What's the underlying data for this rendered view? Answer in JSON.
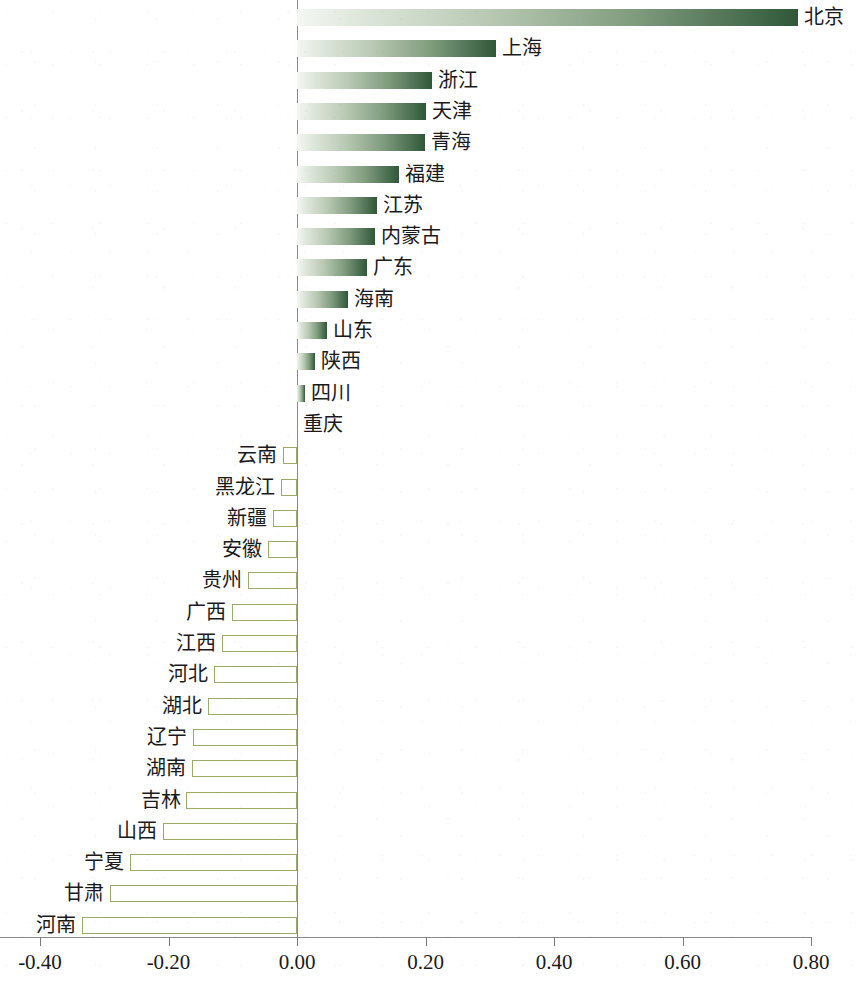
{
  "chart_data": {
    "type": "bar",
    "orientation": "horizontal",
    "title": "",
    "subtitle": "",
    "xlabel": "",
    "ylabel": "",
    "xlim": [
      -0.4,
      0.8
    ],
    "xticks": [
      -0.4,
      -0.2,
      0.0,
      0.2,
      0.4,
      0.6,
      0.8
    ],
    "xtick_labels": [
      "-0.40",
      "-0.20",
      "0.00",
      "0.20",
      "0.40",
      "0.60",
      "0.80"
    ],
    "grid": false,
    "legend": null,
    "legend_position": "none",
    "categories": [
      "北京",
      "上海",
      "浙江",
      "天津",
      "青海",
      "福建",
      "江苏",
      "内蒙古",
      "广东",
      "海南",
      "山东",
      "陕西",
      "四川",
      "重庆",
      "云南",
      "黑龙江",
      "新疆",
      "安徽",
      "贵州",
      "广西",
      "江西",
      "河北",
      "湖北",
      "辽宁",
      "湖南",
      "吉林",
      "山西",
      "宁夏",
      "甘肃",
      "河南"
    ],
    "values": [
      0.78,
      0.31,
      0.21,
      0.2,
      0.199,
      0.159,
      0.125,
      0.121,
      0.109,
      0.079,
      0.047,
      0.028,
      0.012,
      0.0,
      -0.022,
      -0.025,
      -0.037,
      -0.045,
      -0.076,
      -0.101,
      -0.117,
      -0.129,
      -0.139,
      -0.162,
      -0.164,
      -0.172,
      -0.209,
      -0.26,
      -0.291,
      -0.334
    ],
    "colors": {
      "positive_gradient_start": "#f4f7f3",
      "positive_gradient_end": "#2f5738",
      "negative_fill": "#ffffff",
      "negative_border": "#9aab68",
      "axis": "#8a8a8a",
      "text": "#1a1a1a"
    }
  }
}
